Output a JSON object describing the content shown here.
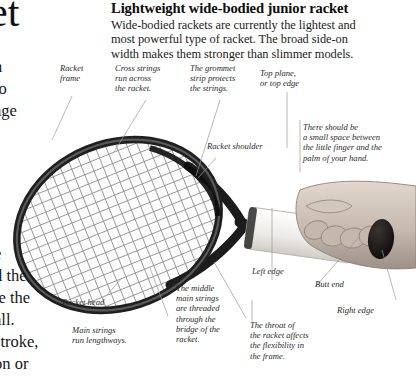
{
  "page": {
    "background": "#ffffff",
    "ink": "#1a1a1a"
  },
  "cut_off_left_column": {
    "title_fragment": "ket",
    "lines_upper": [
      "n",
      "to",
      "age"
    ],
    "lines_lower": [
      "e",
      "d the",
      "le the",
      "all.",
      "stroke,",
      "on or"
    ]
  },
  "heading": {
    "title": "Lightweight wide-bodied junior racket",
    "body_lines": [
      "Wide-bodied rackets are currently the lightest and",
      "most powerful type of racket. The broad side-on",
      "width makes them stronger than slimmer models."
    ]
  },
  "annotations": [
    {
      "name": "racket-frame",
      "lines": [
        "Racket",
        "frame"
      ]
    },
    {
      "name": "cross-strings",
      "lines": [
        "Cross strings",
        "run across",
        "the racket."
      ]
    },
    {
      "name": "grommet-strip",
      "lines": [
        "The grommet",
        "strip protects",
        "the strings."
      ]
    },
    {
      "name": "top-plane",
      "lines": [
        "Top plane,",
        "or top edge"
      ]
    },
    {
      "name": "finger-space",
      "lines": [
        "There should be",
        "a small space between",
        "the little finger and the",
        "palm of your hand."
      ]
    },
    {
      "name": "racket-shoulder",
      "lines": [
        "Racket shoulder"
      ]
    },
    {
      "name": "left-edge",
      "lines": [
        "Left edge"
      ]
    },
    {
      "name": "butt-end",
      "lines": [
        "Butt end"
      ]
    },
    {
      "name": "right-edge",
      "lines": [
        "Right edge"
      ]
    },
    {
      "name": "racket-head",
      "lines": [
        "Racket head"
      ]
    },
    {
      "name": "main-strings",
      "lines": [
        "Main strings",
        "run lengthways."
      ]
    },
    {
      "name": "middle-main-strings",
      "lines": [
        "The middle",
        "main strings",
        "are threaded",
        "through the",
        "bridge of the",
        "racket."
      ]
    },
    {
      "name": "throat-flexibility",
      "lines": [
        "The throat of",
        "the racket affects",
        "the flexibility in",
        "the frame."
      ]
    }
  ],
  "colors": {
    "frame_dark": "#1c1c1c",
    "frame_mid": "#545454",
    "string_gray": "#8e8e8e",
    "leader_gray": "#9a9a9a",
    "grip_white": "#f2f1ef",
    "skin": "#cfc4bb",
    "butt_cap": "#14110f"
  }
}
